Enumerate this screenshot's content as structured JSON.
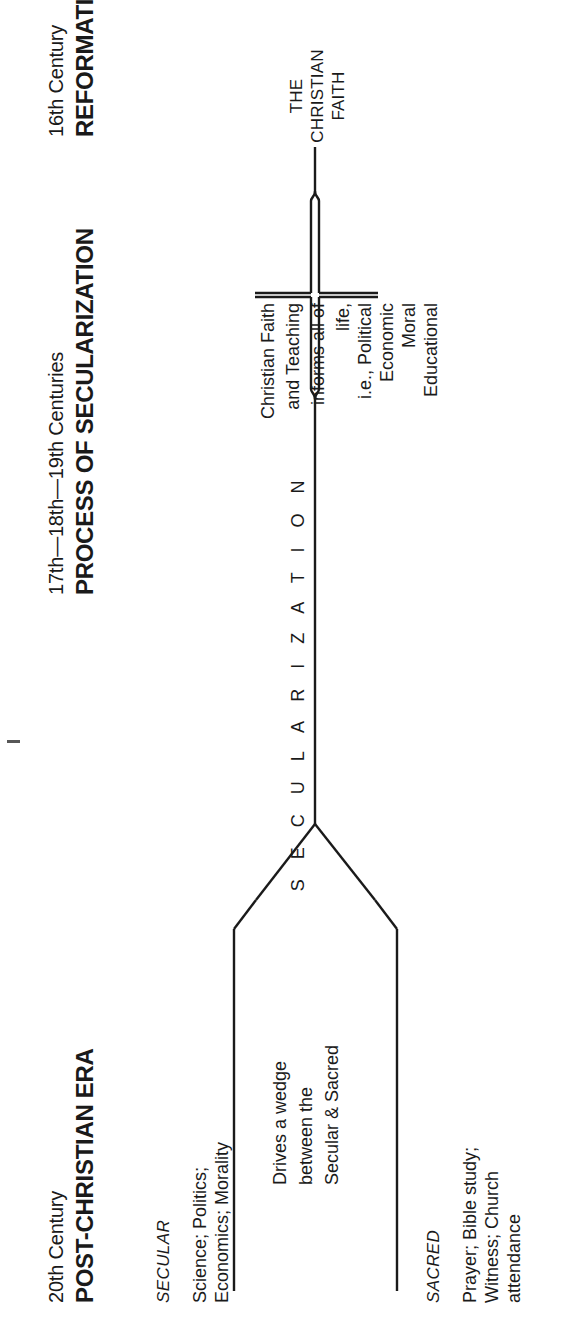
{
  "diagram": {
    "title": "Process of Secularization",
    "orientation": "rotated-90-ccw",
    "ink_color": "#1a1a1a",
    "background_color": "#ffffff"
  },
  "eras": [
    {
      "id": "reformation",
      "period": "16th Century",
      "name": "REFORMATION ERA"
    },
    {
      "id": "secularization",
      "period": "17th—18th—19th Centuries",
      "name": "PROCESS OF SECULARIZATION"
    },
    {
      "id": "post_christian",
      "period": "20th Century",
      "name": "POST-CHRISTIAN ERA"
    }
  ],
  "reformation": {
    "root_label_lines": [
      "THE",
      "CHRISTIAN",
      "FAITH"
    ],
    "brace_text_lines": [
      "Christian Faith",
      "and Teaching",
      "informs all of",
      "life,",
      "i.e., Political",
      "Economic",
      "Moral",
      "Educational"
    ]
  },
  "process": {
    "axis_label": "S E C U L A R I Z A T I O N"
  },
  "post_christian": {
    "wedge_note_lines": [
      "Drives a wedge",
      "between the",
      "Secular & Sacred"
    ],
    "secular": {
      "heading": "SECULAR",
      "items_lines": [
        "Science; Politics;",
        "Economics; Morality"
      ]
    },
    "sacred": {
      "heading": "SACRED",
      "items_lines": [
        "Prayer; Bible study;",
        "Witness; Church",
        "attendance"
      ]
    }
  }
}
